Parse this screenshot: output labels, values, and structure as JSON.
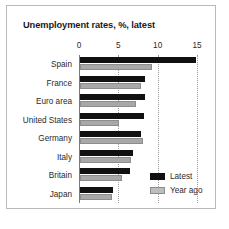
{
  "chart_data": {
    "type": "bar",
    "orientation": "horizontal",
    "title": "Unemployment rates, %, latest",
    "xlabel": "",
    "ylabel": "",
    "xlim": [
      0,
      15
    ],
    "xticks": [
      0,
      5,
      10,
      15
    ],
    "xtick_labels": [
      "0",
      "5",
      "10",
      "15"
    ],
    "grid": "vertical-dotted",
    "legend_position": "bottom-right",
    "categories": [
      "Spain",
      "France",
      "Euro area",
      "United States",
      "Germany",
      "Italy",
      "Britain",
      "Japan"
    ],
    "series": [
      {
        "name": "Latest",
        "color": "#111111",
        "values": [
          14.8,
          8.2,
          8.2,
          8.1,
          7.8,
          6.7,
          6.4,
          4.2
        ]
      },
      {
        "name": "Year ago",
        "color": "#a8a8a8",
        "values": [
          9.1,
          7.8,
          7.1,
          5.0,
          8.0,
          6.5,
          5.3,
          4.1
        ]
      }
    ]
  },
  "legend": {
    "items": [
      {
        "label": "Latest",
        "swatch": "black-square-icon"
      },
      {
        "label": "Year ago",
        "swatch": "gray-square-icon"
      }
    ]
  }
}
